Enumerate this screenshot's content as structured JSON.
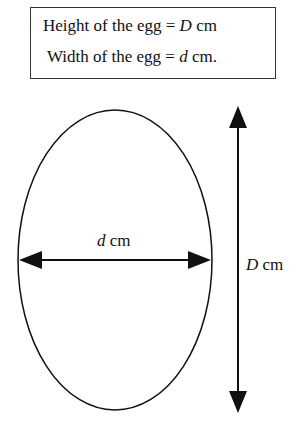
{
  "legend": {
    "height_text": "Height of the egg =",
    "height_var": "D",
    "height_unit": "cm",
    "width_text": "Width of the egg =",
    "width_var": "d",
    "width_unit": "cm."
  },
  "diagram": {
    "width_label_var": "d",
    "width_label_unit": "cm",
    "height_label_var": "D",
    "height_label_unit": "cm"
  }
}
